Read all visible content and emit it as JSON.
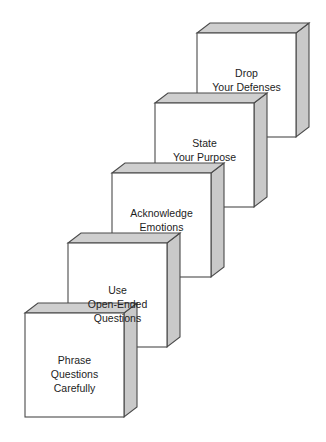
{
  "diagram": {
    "type": "staircase-3d-blocks",
    "title_visible": false,
    "orientation": "descending-left",
    "colors": {
      "front_face": "#ffffff",
      "top_face": "#cfcfcf",
      "side_face": "#c9c9c9",
      "outline": "#4a4a4a",
      "text": "#1d1d1d",
      "background": "#ffffff"
    },
    "geometry": {
      "front_width": 99,
      "front_height": 104,
      "depth_x": 13,
      "depth_y": -10,
      "step_dx": -43,
      "step_dy": 70
    },
    "steps": [
      {
        "order": 5,
        "id": "drop-your-defenses",
        "lines": [
          "Drop",
          "Your Defenses"
        ],
        "x": 197,
        "y": 33
      },
      {
        "order": 4,
        "id": "state-your-purpose",
        "lines": [
          "State",
          "Your Purpose"
        ],
        "x": 155,
        "y": 103
      },
      {
        "order": 3,
        "id": "acknowledge-emotions",
        "lines": [
          "Acknowledge",
          "Emotions"
        ],
        "x": 112,
        "y": 173
      },
      {
        "order": 2,
        "id": "use-open-ended-questions",
        "lines": [
          "Use",
          "Open-Ended",
          "Questions"
        ],
        "x": 68,
        "y": 243
      },
      {
        "order": 1,
        "id": "phrase-questions-carefully",
        "lines": [
          "Phrase",
          "Questions",
          "Carefully"
        ],
        "x": 25,
        "y": 313
      }
    ]
  }
}
